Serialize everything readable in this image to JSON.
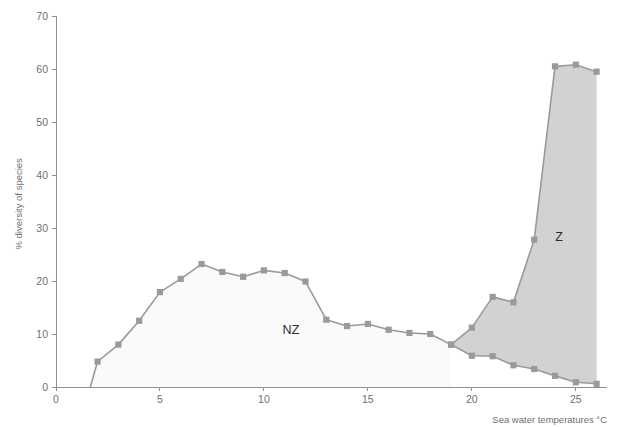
{
  "chart_data": {
    "type": "area",
    "title": "",
    "xlabel": "Sea water temperatures °C",
    "ylabel": "% diversity of species",
    "xlim": [
      0,
      26.5
    ],
    "ylim": [
      0,
      70
    ],
    "xticks": [
      0,
      5,
      10,
      15,
      20,
      25
    ],
    "xtick_labels": [
      "0",
      "5",
      "10",
      "15",
      "20",
      "25"
    ],
    "yticks": [
      0,
      10,
      20,
      30,
      40,
      50,
      60,
      70
    ],
    "ytick_labels": [
      "0",
      "10",
      "20",
      "30",
      "40",
      "50",
      "60",
      "70"
    ],
    "grid": false,
    "legend_position": "inline-annotation",
    "annotations": [
      {
        "text": "NZ",
        "x": 11.3,
        "y": 10.0
      },
      {
        "text": "Z",
        "x": 24.2,
        "y": 27.5
      }
    ],
    "series": [
      {
        "name": "upper",
        "label": "NZ upper boundary / Z upper boundary",
        "color": "#9a9a9a",
        "x": [
          1.65,
          2.0,
          3.0,
          4.0,
          5.0,
          6.0,
          7.0,
          8.0,
          9.0,
          10.0,
          11.0,
          12.0,
          13.0,
          14.0,
          15.0,
          16.0,
          17.0,
          18.0,
          19.0,
          20.0,
          21.0,
          22.0,
          23.0,
          24.0,
          25.0,
          26.0
        ],
        "y": [
          0.0,
          4.8,
          8.0,
          12.5,
          17.9,
          20.4,
          23.2,
          21.7,
          20.8,
          22.0,
          21.5,
          19.9,
          12.7,
          11.5,
          11.9,
          10.8,
          10.2,
          10.0,
          8.0,
          11.2,
          17.0,
          16.0,
          27.8,
          60.5,
          60.8,
          59.5
        ]
      },
      {
        "name": "lower",
        "label": "Z lower boundary",
        "color": "#9a9a9a",
        "x": [
          19.0,
          20.0,
          21.0,
          22.0,
          23.0,
          24.0,
          25.0,
          26.0
        ],
        "y": [
          8.0,
          5.9,
          5.8,
          4.1,
          3.4,
          2.1,
          0.9,
          0.6
        ]
      }
    ],
    "regions": [
      {
        "name": "NZ",
        "fill": "#fbfafa",
        "description": "Non-zooxanthellate area under the upper curve from 1.65 to 19"
      },
      {
        "name": "Z",
        "fill": "#d2d2d2",
        "description": "Zooxanthellate area between upper and lower curves from 19 to 26"
      }
    ],
    "colors": {
      "line": "#9a9a9a",
      "marker": "#9a9a9a",
      "axis": "#8f8f8f",
      "tick_text": "#6f6f6f",
      "nz_fill": "#fbfafa",
      "z_fill": "#d2d2d2",
      "annotation_text": "#2b2b2b",
      "background": "#ffffff"
    }
  }
}
